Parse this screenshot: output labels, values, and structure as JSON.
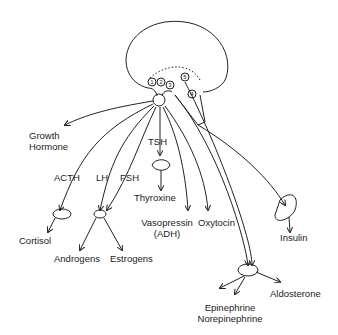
{
  "diagram": {
    "type": "endocrine-system-diagram",
    "structures": {
      "brain": "hypothalamus-brain-outline",
      "pituitary": "pituitary-stalk",
      "nuclei": [
        "1",
        "2",
        "3",
        "4",
        "5"
      ]
    },
    "hormones": {
      "growth_hormone": "Growth\nHormone",
      "acth": "ACTH",
      "lh": "LH",
      "fsh": "FSH",
      "tsh": "TSH",
      "thyroxine": "Thyroxine",
      "vasopressin": "Vasopressin",
      "adh": "(ADH)",
      "oxytocin": "Oxytocin",
      "insulin": "Insulin",
      "cortisol": "Cortisol",
      "androgens": "Androgens",
      "estrogens": "Estrogens",
      "aldosterone": "Aldosterone",
      "epinephrine": "Epinephrine",
      "norepinephrine": "Norepinephrine"
    }
  }
}
